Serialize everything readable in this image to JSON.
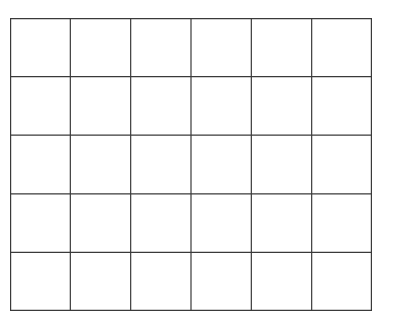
{
  "grid": {
    "rows": 5,
    "columns": 6,
    "line_color": "#3a3a3a",
    "background": "#ffffff",
    "cells": [
      [
        "",
        "",
        "",
        "",
        "",
        ""
      ],
      [
        "",
        "",
        "",
        "",
        "",
        ""
      ],
      [
        "",
        "",
        "",
        "",
        "",
        ""
      ],
      [
        "",
        "",
        "",
        "",
        "",
        ""
      ],
      [
        "",
        "",
        "",
        "",
        "",
        ""
      ]
    ]
  }
}
